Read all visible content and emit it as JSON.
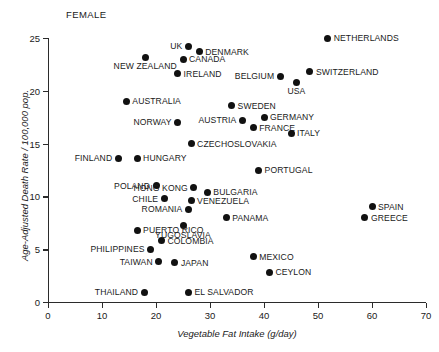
{
  "title_partial": "",
  "panel_label": "FEMALE",
  "chart_data": {
    "type": "scatter",
    "title": "",
    "panel_annotation": "FEMALE",
    "xlabel": "Vegetable Fat Intake (g/day)",
    "ylabel": "Age-Adjusted Death Rate / 100,000 pop.",
    "xlim": [
      0,
      70
    ],
    "ylim": [
      0,
      25
    ],
    "xticks": [
      0,
      10,
      20,
      30,
      40,
      50,
      60,
      70
    ],
    "yticks": [
      0,
      5,
      10,
      15,
      20,
      25
    ],
    "grid": false,
    "legend": null,
    "points": [
      {
        "label": "NETHERLANDS",
        "x": 51.8,
        "y": 25.0,
        "lpos": "right"
      },
      {
        "label": "UK",
        "x": 26.0,
        "y": 24.2,
        "lpos": "left"
      },
      {
        "label": "DENMARK",
        "x": 28.0,
        "y": 23.7,
        "lpos": "right"
      },
      {
        "label": "CANADA",
        "x": 25.0,
        "y": 23.0,
        "lpos": "right"
      },
      {
        "label": "NEW ZEALAND",
        "x": 18.0,
        "y": 23.2,
        "lpos": "below"
      },
      {
        "label": "IRELAND",
        "x": 24.0,
        "y": 21.6,
        "lpos": "right"
      },
      {
        "label": "SWITZERLAND",
        "x": 48.5,
        "y": 21.8,
        "lpos": "right"
      },
      {
        "label": "BELGIUM",
        "x": 43.0,
        "y": 21.4,
        "lpos": "left"
      },
      {
        "label": "USA",
        "x": 46.0,
        "y": 20.8,
        "lpos": "below"
      },
      {
        "label": "AUSTRALIA",
        "x": 14.5,
        "y": 19.0,
        "lpos": "right"
      },
      {
        "label": "SWEDEN",
        "x": 34.0,
        "y": 18.6,
        "lpos": "right"
      },
      {
        "label": "GERMANY",
        "x": 40.0,
        "y": 17.5,
        "lpos": "right"
      },
      {
        "label": "AUSTRIA",
        "x": 36.0,
        "y": 17.2,
        "lpos": "left"
      },
      {
        "label": "NORWAY",
        "x": 24.0,
        "y": 17.0,
        "lpos": "left"
      },
      {
        "label": "FRANCE",
        "x": 38.0,
        "y": 16.5,
        "lpos": "right"
      },
      {
        "label": "ITALY",
        "x": 45.0,
        "y": 16.0,
        "lpos": "right"
      },
      {
        "label": "CZECHOSLOVAKIA",
        "x": 26.5,
        "y": 15.0,
        "lpos": "right"
      },
      {
        "label": "FINLAND",
        "x": 13.0,
        "y": 13.6,
        "lpos": "left"
      },
      {
        "label": "HUNGARY",
        "x": 16.5,
        "y": 13.6,
        "lpos": "right"
      },
      {
        "label": "PORTUGAL",
        "x": 39.0,
        "y": 12.5,
        "lpos": "right"
      },
      {
        "label": "POLAND",
        "x": 20.0,
        "y": 11.0,
        "lpos": "left"
      },
      {
        "label": "HONG KONG",
        "x": 27.0,
        "y": 10.8,
        "lpos": "left"
      },
      {
        "label": "BULGARIA",
        "x": 29.5,
        "y": 10.4,
        "lpos": "right"
      },
      {
        "label": "CHILE",
        "x": 21.5,
        "y": 9.8,
        "lpos": "left"
      },
      {
        "label": "VENEZUELA",
        "x": 26.5,
        "y": 9.6,
        "lpos": "right"
      },
      {
        "label": "SPAIN",
        "x": 60.0,
        "y": 9.0,
        "lpos": "right"
      },
      {
        "label": "ROMANIA",
        "x": 26.0,
        "y": 8.8,
        "lpos": "left"
      },
      {
        "label": "PANAMA",
        "x": 33.0,
        "y": 8.0,
        "lpos": "right"
      },
      {
        "label": "GREECE",
        "x": 58.7,
        "y": 8.0,
        "lpos": "right"
      },
      {
        "label": "YUGOSLAVIA",
        "x": 25.0,
        "y": 7.2,
        "lpos": "below"
      },
      {
        "label": "PUERTO RICO",
        "x": 16.5,
        "y": 6.8,
        "lpos": "right"
      },
      {
        "label": "COLOMBIA",
        "x": 21.0,
        "y": 5.8,
        "lpos": "right"
      },
      {
        "label": "PHILIPPINES",
        "x": 19.0,
        "y": 5.0,
        "lpos": "left"
      },
      {
        "label": "MEXICO",
        "x": 38.0,
        "y": 4.3,
        "lpos": "right"
      },
      {
        "label": "TAIWAN",
        "x": 20.5,
        "y": 3.8,
        "lpos": "left"
      },
      {
        "label": "JAPAN",
        "x": 23.5,
        "y": 3.7,
        "lpos": "right"
      },
      {
        "label": "CEYLON",
        "x": 41.0,
        "y": 2.8,
        "lpos": "right"
      },
      {
        "label": "THAILAND",
        "x": 17.8,
        "y": 0.9,
        "lpos": "left"
      },
      {
        "label": "EL SALVADOR",
        "x": 26.0,
        "y": 0.9,
        "lpos": "right"
      }
    ]
  }
}
